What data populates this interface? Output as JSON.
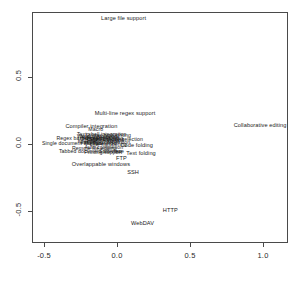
{
  "chart_data": {
    "type": "scatter",
    "title": "",
    "subtitle": "",
    "xlabel": "",
    "ylabel": "",
    "xlim": [
      -0.72,
      1.23
    ],
    "ylim": [
      -0.68,
      1.04
    ],
    "grid": false,
    "legend": null,
    "marker": "text-label",
    "xticks": [
      "-0.5",
      "0.0",
      "0.5",
      "1.0"
    ],
    "xtick_values": [
      -0.5,
      0.0,
      0.5,
      1.0
    ],
    "yticks": [
      "0.5",
      "0.0",
      "-0.5"
    ],
    "ytick_values": [
      0.5,
      0.0,
      -0.5
    ],
    "points": [
      {
        "label": "Large file support",
        "x": 0.045,
        "y": 0.935
      },
      {
        "label": "Multi-line regex support",
        "x": 0.055,
        "y": 0.225
      },
      {
        "label": "Collaborative editing",
        "x": 0.98,
        "y": 0.135
      },
      {
        "label": "Compiler integration",
        "x": -0.175,
        "y": 0.13
      },
      {
        "label": "Macro",
        "x": -0.145,
        "y": 0.105
      },
      {
        "label": "Text shell integration",
        "x": -0.105,
        "y": 0.068
      },
      {
        "label": "Syntax highlighting",
        "x": -0.06,
        "y": 0.06
      },
      {
        "label": "Word completion",
        "x": -0.135,
        "y": 0.055
      },
      {
        "label": "Auto indentation",
        "x": -0.12,
        "y": 0.048
      },
      {
        "label": "Bracket matching",
        "x": -0.1,
        "y": 0.04
      },
      {
        "label": "Regex based search",
        "x": -0.245,
        "y": 0.035
      },
      {
        "label": "Spell checking",
        "x": -0.07,
        "y": 0.03
      },
      {
        "label": "Column mode selection",
        "x": -0.015,
        "y": 0.03
      },
      {
        "label": "Block selection",
        "x": -0.095,
        "y": 0.022
      },
      {
        "label": "Keyboard macros",
        "x": -0.125,
        "y": 0.018
      },
      {
        "label": "Encoding conversion",
        "x": -0.08,
        "y": 0.01
      },
      {
        "label": "Single document interface",
        "x": -0.3,
        "y": 0.002
      },
      {
        "label": "Multiple undo",
        "x": -0.115,
        "y": 0.0
      },
      {
        "label": "Line numbering",
        "x": -0.06,
        "y": -0.005
      },
      {
        "label": "Code folding",
        "x": 0.135,
        "y": -0.018
      },
      {
        "label": "Auto completion",
        "x": -0.09,
        "y": -0.028
      },
      {
        "label": "Remote file editing",
        "x": -0.155,
        "y": -0.035
      },
      {
        "label": "Tabbed document interface",
        "x": -0.175,
        "y": -0.058
      },
      {
        "label": "Split view",
        "x": -0.045,
        "y": -0.06
      },
      {
        "label": "Printing support",
        "x": -0.095,
        "y": -0.065
      },
      {
        "label": "Text folding",
        "x": 0.165,
        "y": -0.072
      },
      {
        "label": "FTP",
        "x": 0.03,
        "y": -0.115
      },
      {
        "label": "Overlappable windows",
        "x": -0.11,
        "y": -0.158
      },
      {
        "label": "SSH",
        "x": 0.11,
        "y": -0.215
      },
      {
        "label": "HTTP",
        "x": 0.365,
        "y": -0.5
      },
      {
        "label": "WebDAV",
        "x": 0.175,
        "y": -0.6
      }
    ]
  }
}
